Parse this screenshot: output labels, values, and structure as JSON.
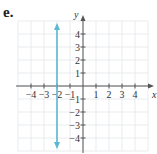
{
  "panel_label": "e.",
  "chart_data": {
    "type": "line",
    "title": "",
    "xlabel": "x",
    "ylabel": "y",
    "xlim": [
      -5,
      5
    ],
    "ylim": [
      -5,
      5
    ],
    "grid": true,
    "x_ticks": [
      -4,
      -3,
      -2,
      -1,
      1,
      2,
      3,
      4
    ],
    "y_ticks": [
      -4,
      -3,
      -2,
      -1,
      1,
      2,
      3,
      4
    ],
    "x_tick_labels": [
      "−4",
      "−3",
      "−2",
      "−1",
      "1",
      "2",
      "3",
      "4"
    ],
    "y_tick_labels": [
      "−4",
      "−3",
      "−2",
      "−1",
      "1",
      "2",
      "3",
      "4"
    ],
    "series": [
      {
        "name": "x = -2",
        "kind": "vertical-line",
        "x": -2,
        "y_range": [
          -5,
          5
        ],
        "arrows": "both",
        "color": "#5bb8d4"
      }
    ]
  }
}
